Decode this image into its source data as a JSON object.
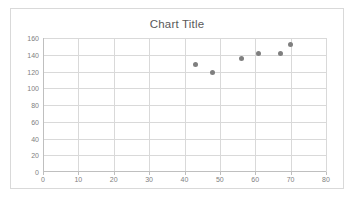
{
  "chart_data": {
    "type": "scatter",
    "title": "Chart Title",
    "xlabel": "",
    "ylabel": "",
    "xlim": [
      0,
      80
    ],
    "ylim": [
      0,
      160
    ],
    "xticks": [
      0,
      10,
      20,
      30,
      40,
      50,
      60,
      70,
      80
    ],
    "yticks": [
      0,
      20,
      40,
      60,
      80,
      100,
      120,
      140,
      160
    ],
    "grid": true,
    "legend": false,
    "legend_position": "none",
    "marker_color": "#7f7f7f",
    "gridline_color": "#d9d9d9",
    "axis_color": "#bfbfbf",
    "text_color": "#808080",
    "title_color": "#595959",
    "series": [
      {
        "name": "Series 1",
        "x": [
          43,
          48,
          56,
          61,
          67,
          70
        ],
        "y": [
          128,
          119,
          135,
          142,
          141,
          152
        ]
      }
    ]
  },
  "chart": {
    "title": "Chart Title",
    "y_tick_labels": [
      "160",
      "140",
      "120",
      "100",
      "80",
      "60",
      "40",
      "20",
      "0"
    ],
    "x_tick_labels": [
      "0",
      "10",
      "20",
      "30",
      "40",
      "50",
      "60",
      "70",
      "80"
    ]
  }
}
